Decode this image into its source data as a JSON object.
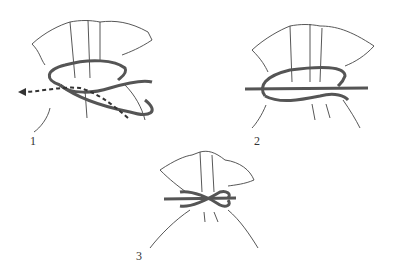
{
  "diagram": {
    "steps": [
      {
        "label": "1",
        "description": "Wrap cord around bag neck and pass end through loop (dashed arrow shows direction)"
      },
      {
        "label": "2",
        "description": "Pull both ends to tighten the loop"
      },
      {
        "label": "3",
        "description": "Finished knot with cord tied around bag neck"
      }
    ],
    "colors": {
      "line": "#333333",
      "cord": "#555555",
      "background": "#ffffff"
    }
  }
}
